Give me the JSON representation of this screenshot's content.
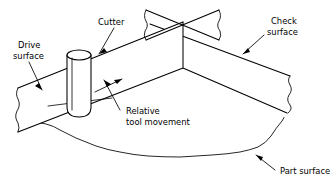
{
  "figure": {
    "type": "technical-line-diagram",
    "background_color": "#ffffff",
    "line_color": "#000000"
  },
  "labels": {
    "cutter": "Cutter",
    "drive_surface_line1": "Drive",
    "drive_surface_line2": "surface",
    "check_surface_line1": "Check",
    "check_surface_line2": "surface",
    "relative_line1": "Relative",
    "relative_line2": "tool movement",
    "part_surface": "Part surface"
  },
  "icons": {
    "cutter": "cylinder-tool-icon",
    "motion": "arrow-up-right-icon",
    "leader": "leader-line-icon",
    "torn_edge": "torn-edge-icon"
  }
}
